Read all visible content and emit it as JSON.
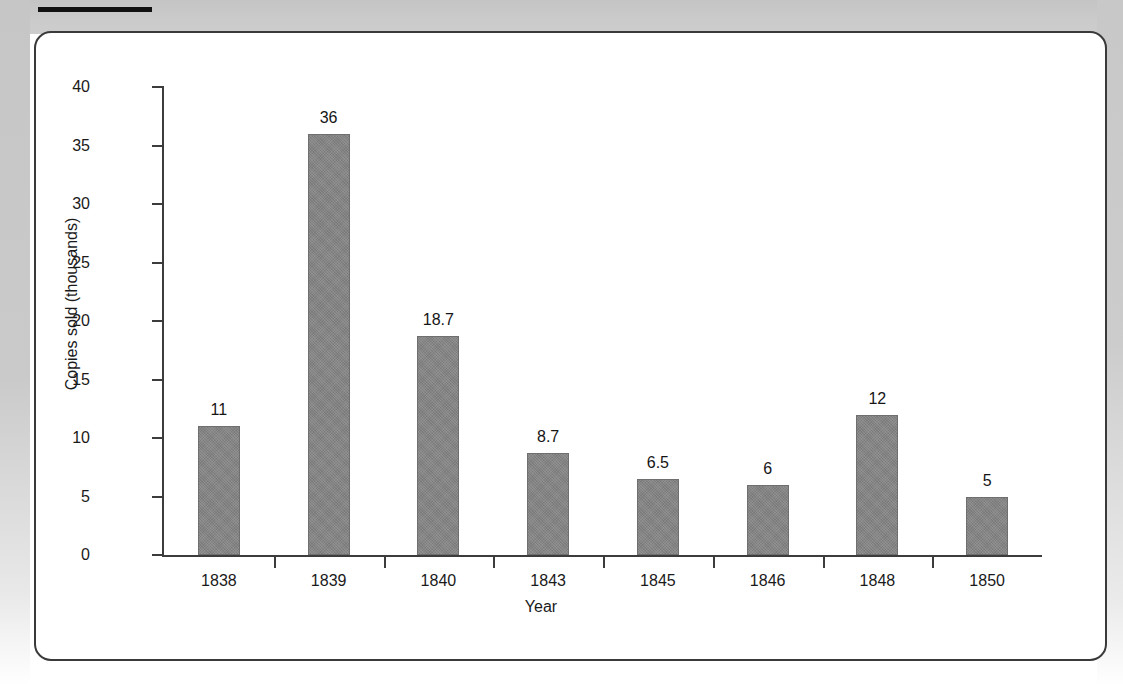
{
  "page": {
    "background_color": "#c9c9c9",
    "panel_color": "#ffffff",
    "rule_color": "#111111",
    "bar_color": "#858585",
    "axis_color": "#3c3c3c"
  },
  "chart_data": {
    "type": "bar",
    "title": "",
    "subtitle": "",
    "xlabel": "Year",
    "ylabel": "Copies sold (thousands)",
    "categories": [
      "1838",
      "1839",
      "1840",
      "1843",
      "1845",
      "1846",
      "1848",
      "1850"
    ],
    "values": [
      11,
      36,
      18.7,
      8.7,
      6.5,
      6,
      12,
      5
    ],
    "data_labels": [
      "11",
      "36",
      "18.7",
      "8.7",
      "6.5",
      "6",
      "12",
      "5"
    ],
    "ylim": [
      0,
      40
    ],
    "yticks": [
      0,
      5,
      10,
      15,
      20,
      25,
      30,
      35,
      40
    ],
    "ytick_labels": [
      "0",
      "5",
      "10",
      "15",
      "20",
      "25",
      "30",
      "35",
      "40"
    ],
    "grid": false,
    "legend": false,
    "legend_position": "none",
    "series": [
      {
        "name": "Copies sold (thousands)",
        "values": [
          11,
          36,
          18.7,
          8.7,
          6.5,
          6,
          12,
          5
        ]
      }
    ]
  }
}
